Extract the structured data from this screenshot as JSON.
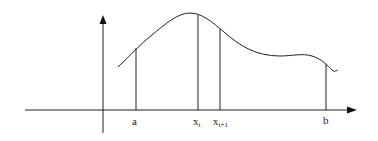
{
  "diagram": {
    "type": "function-plot-riemann-partition",
    "colors": {
      "stroke": "#222222",
      "background": "#ffffff"
    },
    "axes": {
      "x_axis": {
        "has_arrow": true,
        "label": ""
      },
      "y_axis": {
        "has_arrow": true,
        "label": ""
      }
    },
    "labels": {
      "a": "a",
      "x_i_base": "x",
      "x_i_sub": "i",
      "x_i1_base": "x",
      "x_i1_sub": "i+1",
      "b": "b"
    },
    "vertical_lines": [
      "a",
      "x_i",
      "x_{i+1}",
      "b"
    ],
    "curve": {
      "description": "smooth curve rising to a peak near x_i, descending, then a small bump before b"
    }
  }
}
